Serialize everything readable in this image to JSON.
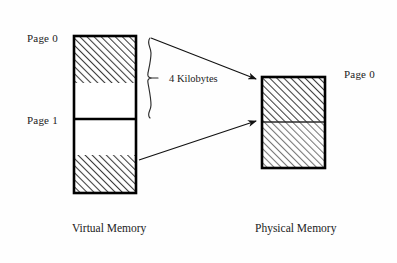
{
  "diagram": {
    "title_virtual": "Virtual Memory",
    "title_physical": "Physical Memory",
    "labels": {
      "virtual_page0": "Page 0",
      "virtual_page1": "Page 1",
      "physical_page0": "Page 0"
    },
    "annotations": {
      "page_size": "4 Kilobytes"
    },
    "colors": {
      "outline": "#000000",
      "hatch": "#4a4a4a",
      "fill_empty": "#ffffff",
      "background": "#fefefe",
      "text": "#222222"
    },
    "blocks": {
      "virtual": {
        "x": 74,
        "y": 36,
        "w": 62,
        "h": 157,
        "segments": [
          {
            "name": "page0-mapped",
            "y": 36,
            "h": 47,
            "fill": "hatched"
          },
          {
            "name": "page0-unmapped",
            "y": 83,
            "h": 36,
            "fill": "empty"
          },
          {
            "name": "page1-unmapped",
            "y": 119,
            "h": 36,
            "fill": "empty"
          },
          {
            "name": "page1-mapped",
            "y": 155,
            "h": 38,
            "fill": "hatched"
          }
        ]
      },
      "physical": {
        "x": 262,
        "y": 77,
        "w": 63,
        "h": 91,
        "segments": [
          {
            "name": "frame-upper",
            "y": 77,
            "h": 45,
            "fill": "hatched"
          },
          {
            "name": "frame-lower",
            "y": 122,
            "h": 46,
            "fill": "hatched-light"
          }
        ]
      }
    },
    "arrows": [
      {
        "name": "arrow-page0-to-frame",
        "x1": 158,
        "y1": 41,
        "x2": 258,
        "y2": 79
      },
      {
        "name": "arrow-page1-to-frame",
        "x1": 142,
        "y1": 159,
        "x2": 258,
        "y2": 122
      }
    ],
    "brace": {
      "name": "page-size-brace",
      "x": 152,
      "y_top": 38,
      "y_bottom": 118,
      "y_tip": 78
    }
  }
}
